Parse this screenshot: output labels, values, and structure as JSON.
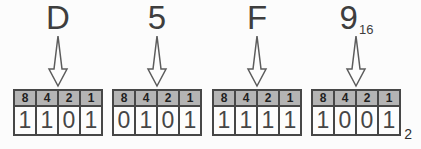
{
  "diagram": {
    "colors": {
      "background": "#fcfcfc",
      "header_bg": "#b4b4b4",
      "table_border": "#474747",
      "digit_text": "#464646",
      "label_text": "#3e3e3e",
      "arrow_stroke": "#5c5c5c"
    }
  },
  "groups": [
    {
      "hex": "D",
      "hex_sub": "",
      "weights": [
        "8",
        "4",
        "2",
        "1"
      ],
      "bits": [
        "1",
        "1",
        "0",
        "1"
      ],
      "result_sub": ""
    },
    {
      "hex": "5",
      "hex_sub": "",
      "weights": [
        "8",
        "4",
        "2",
        "1"
      ],
      "bits": [
        "0",
        "1",
        "0",
        "1"
      ],
      "result_sub": ""
    },
    {
      "hex": "F",
      "hex_sub": "",
      "weights": [
        "8",
        "4",
        "2",
        "1"
      ],
      "bits": [
        "1",
        "1",
        "1",
        "1"
      ],
      "result_sub": ""
    },
    {
      "hex": "9",
      "hex_sub": "16",
      "weights": [
        "8",
        "4",
        "2",
        "1"
      ],
      "bits": [
        "1",
        "0",
        "0",
        "1"
      ],
      "result_sub": "2"
    }
  ]
}
